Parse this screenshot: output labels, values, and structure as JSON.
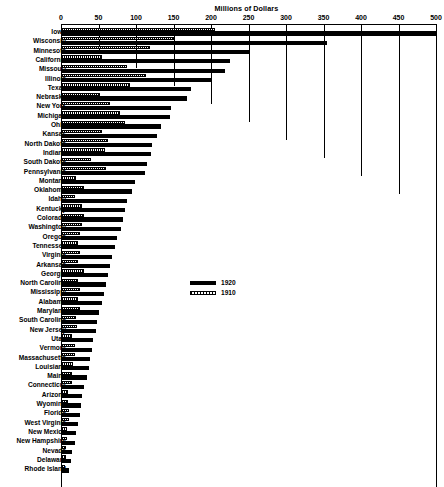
{
  "chart_data": {
    "type": "bar",
    "orientation": "horizontal",
    "title": "Millions of Dollars",
    "xlabel": "Millions of Dollars",
    "ylabel": "",
    "xlim": [
      0,
      500
    ],
    "xticks": [
      0,
      50,
      100,
      150,
      200,
      250,
      300,
      350,
      400,
      450,
      500
    ],
    "grid": true,
    "legend_position": "center",
    "categories": [
      "Iowa",
      "Wisconsin",
      "Minnesota",
      "California",
      "Missouri",
      "Illinois",
      "Texas",
      "Nebraska",
      "New York",
      "Michigan",
      "Ohio",
      "Kansas",
      "North Dakota",
      "Indiana",
      "South Dakota",
      "Pennsylvania",
      "Montana",
      "Oklahoma",
      "Idaho",
      "Kentucky",
      "Colorado",
      "Washington",
      "Oregon",
      "Tennessee",
      "Virginia",
      "Arkansas",
      "Georgia",
      "North Carolina",
      "Mississippi",
      "Alabama",
      "Maryland",
      "South Carolina",
      "New Jersey",
      "Utah",
      "Vermont",
      "Massachusetts",
      "Louisiana",
      "Maine",
      "Connecticut",
      "Arizona",
      "Wyoming",
      "Florida",
      "West Virginia",
      "New Mexico",
      "New Hampshire",
      "Nevada",
      "Delaware",
      "Rhode Island"
    ],
    "series": [
      {
        "name": "1920",
        "color": "#000000",
        "values": [
          500,
          355,
          250,
          225,
          218,
          200,
          173,
          168,
          147,
          145,
          133,
          128,
          121,
          120,
          115,
          112,
          98,
          95,
          88,
          85,
          83,
          80,
          75,
          72,
          68,
          65,
          62,
          60,
          57,
          55,
          50,
          48,
          46,
          43,
          41,
          39,
          37,
          34,
          31,
          28,
          26,
          25,
          23,
          20,
          18,
          15,
          13,
          11
        ]
      },
      {
        "name": "1910",
        "color": "#000000",
        "pattern": "hatched",
        "values": [
          205,
          150,
          118,
          55,
          88,
          113,
          92,
          52,
          65,
          78,
          85,
          55,
          63,
          58,
          40,
          60,
          20,
          30,
          18,
          28,
          30,
          28,
          25,
          22,
          25,
          22,
          30,
          23,
          25,
          22,
          25,
          20,
          21,
          14,
          19,
          18,
          16,
          15,
          14,
          9,
          9,
          11,
          10,
          8,
          8,
          6,
          6,
          5
        ]
      }
    ],
    "gridline_depths": [
      487,
      50,
      68,
      86,
      104,
      122,
      140,
      158,
      176,
      194,
      487
    ]
  },
  "legend": {
    "items": [
      {
        "label": "1920",
        "swatch": "solid-black-swatch"
      },
      {
        "label": "1910",
        "swatch": "hatched-swatch"
      }
    ]
  }
}
